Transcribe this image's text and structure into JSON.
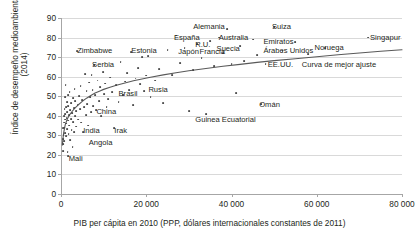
{
  "chart_data": {
    "type": "scatter",
    "title": "",
    "xlabel": "PIB per cápita en 2010 (PPP, dólares internacionales constantes de 2011)",
    "ylabel": "Índice de desempeño medioambiental\n(2014)",
    "xlim": [
      0,
      80000
    ],
    "ylim": [
      0,
      90
    ],
    "xticks": [
      0,
      20000,
      40000,
      60000,
      80000
    ],
    "xticklabels": [
      "0",
      "20 000",
      "40 000",
      "60 000",
      "80 000"
    ],
    "yticks": [
      0,
      10,
      20,
      30,
      40,
      50,
      60,
      70,
      80,
      90
    ],
    "yticklabels": [
      "0",
      "10",
      "20",
      "30",
      "40",
      "50",
      "60",
      "70",
      "80",
      "90"
    ],
    "grid": "horizontal",
    "legend": "none",
    "point_color": "#4a4a4a",
    "curve_color": "#595959",
    "grid_color": "#d9d9d9",
    "annotations": [
      {
        "text": "Zimbabwe",
        "x": 3800,
        "y": 73,
        "align": "left"
      },
      {
        "text": "Serbia",
        "x": 7300,
        "y": 66,
        "align": "left"
      },
      {
        "text": "Estonia",
        "x": 16500,
        "y": 73,
        "align": "left"
      },
      {
        "text": "España",
        "x": 26500,
        "y": 80,
        "align": "left"
      },
      {
        "text": "Alemania",
        "x": 31000,
        "y": 85.5,
        "align": "left"
      },
      {
        "text": "Suiza",
        "x": 49500,
        "y": 85.5,
        "align": "left"
      },
      {
        "text": "Australia",
        "x": 37000,
        "y": 80,
        "align": "left"
      },
      {
        "text": "R.U.",
        "x": 31500,
        "y": 76,
        "align": "left"
      },
      {
        "text": "Suecia",
        "x": 36500,
        "y": 74,
        "align": "left"
      },
      {
        "text": "Japón",
        "x": 27500,
        "y": 72.5,
        "align": "left"
      },
      {
        "text": "Francia",
        "x": 32500,
        "y": 72.5,
        "align": "left"
      },
      {
        "text": "Emiratos\nÁrabes Unidos",
        "x": 47500,
        "y": 77.5,
        "align": "left"
      },
      {
        "text": "Noruega",
        "x": 59500,
        "y": 74.5,
        "align": "left"
      },
      {
        "text": "Singapur",
        "x": 72500,
        "y": 80,
        "align": "left"
      },
      {
        "text": "EE.UU.",
        "x": 48500,
        "y": 66,
        "align": "left"
      },
      {
        "text": "Curva de mejor ajuste",
        "x": 56500,
        "y": 66,
        "align": "left"
      },
      {
        "text": "Brasil",
        "x": 13500,
        "y": 51,
        "align": "left"
      },
      {
        "text": "Rusia",
        "x": 20500,
        "y": 53,
        "align": "left"
      },
      {
        "text": "China",
        "x": 8300,
        "y": 42,
        "align": "left"
      },
      {
        "text": "India",
        "x": 5200,
        "y": 32,
        "align": "left"
      },
      {
        "text": "Irak",
        "x": 12500,
        "y": 32,
        "align": "left"
      },
      {
        "text": "Angola",
        "x": 6500,
        "y": 26,
        "align": "left"
      },
      {
        "text": "Mali",
        "x": 1800,
        "y": 18,
        "align": "left"
      },
      {
        "text": "Omán",
        "x": 46500,
        "y": 45.5,
        "align": "left"
      },
      {
        "text": "Guinea Ecuatorial",
        "x": 31500,
        "y": 38,
        "align": "left"
      }
    ],
    "fit_curve": {
      "label": "Curva de mejor ajuste",
      "points": [
        [
          300,
          25.0
        ],
        [
          600,
          31.0
        ],
        [
          1000,
          35.5
        ],
        [
          1500,
          38.5
        ],
        [
          2000,
          40.5
        ],
        [
          2600,
          42.2
        ],
        [
          3200,
          43.8
        ],
        [
          4000,
          45.5
        ],
        [
          5000,
          47.4
        ],
        [
          6000,
          49.0
        ],
        [
          7000,
          50.4
        ],
        [
          8000,
          51.6
        ],
        [
          9000,
          52.6
        ],
        [
          10000,
          53.5
        ],
        [
          11500,
          54.6
        ],
        [
          13000,
          55.6
        ],
        [
          15000,
          56.8
        ],
        [
          17000,
          57.9
        ],
        [
          19000,
          58.8
        ],
        [
          21000,
          59.7
        ],
        [
          24000,
          60.9
        ],
        [
          27000,
          62.0
        ],
        [
          30000,
          63.0
        ],
        [
          34000,
          64.2
        ],
        [
          38000,
          65.3
        ],
        [
          42000,
          66.3
        ],
        [
          46000,
          67.3
        ],
        [
          50000,
          68.2
        ],
        [
          55000,
          69.2
        ],
        [
          60000,
          70.2
        ],
        [
          65000,
          71.2
        ],
        [
          70000,
          72.1
        ],
        [
          75000,
          73.0
        ],
        [
          80000,
          73.8
        ]
      ]
    },
    "points": [
      [
        400,
        25.5
      ],
      [
        450,
        22.0
      ],
      [
        500,
        28.0
      ],
      [
        550,
        33.5
      ],
      [
        600,
        30.0
      ],
      [
        650,
        36.5
      ],
      [
        700,
        27.0
      ],
      [
        750,
        40.0
      ],
      [
        800,
        34.0
      ],
      [
        850,
        43.5
      ],
      [
        900,
        38.0
      ],
      [
        950,
        31.0
      ],
      [
        1000,
        49.5
      ],
      [
        1050,
        41.0
      ],
      [
        1100,
        55.8
      ],
      [
        1150,
        36.0
      ],
      [
        1200,
        29.5
      ],
      [
        1250,
        44.5
      ],
      [
        1300,
        39.0
      ],
      [
        1350,
        47.0
      ],
      [
        1400,
        33.0
      ],
      [
        1500,
        42.0
      ],
      [
        1550,
        21.5
      ],
      [
        1600,
        37.5
      ],
      [
        1650,
        50.5
      ],
      [
        1700,
        19.5
      ],
      [
        1750,
        45.0
      ],
      [
        1800,
        30.5
      ],
      [
        1900,
        40.5
      ],
      [
        1950,
        35.0
      ],
      [
        2000,
        52.0
      ],
      [
        2100,
        27.5
      ],
      [
        2200,
        43.0
      ],
      [
        2300,
        38.5
      ],
      [
        2400,
        46.5
      ],
      [
        2500,
        32.5
      ],
      [
        2600,
        41.5
      ],
      [
        2700,
        24.0
      ],
      [
        2800,
        49.0
      ],
      [
        2900,
        36.8
      ],
      [
        3000,
        44.0
      ],
      [
        3100,
        31.5
      ],
      [
        3200,
        53.5
      ],
      [
        3300,
        40.0
      ],
      [
        3400,
        47.5
      ],
      [
        3500,
        34.5
      ],
      [
        3600,
        42.5
      ],
      [
        3800,
        73.0
      ],
      [
        3900,
        45.5
      ],
      [
        4000,
        38.0
      ],
      [
        4200,
        50.0
      ],
      [
        4400,
        43.5
      ],
      [
        4600,
        55.0
      ],
      [
        4800,
        36.5
      ],
      [
        5000,
        48.0
      ],
      [
        5200,
        31.5
      ],
      [
        5400,
        44.5
      ],
      [
        5600,
        61.5
      ],
      [
        5800,
        40.5
      ],
      [
        6000,
        52.5
      ],
      [
        6200,
        46.0
      ],
      [
        6400,
        35.0
      ],
      [
        6600,
        57.0
      ],
      [
        6800,
        49.5
      ],
      [
        7000,
        42.0
      ],
      [
        7200,
        61.0
      ],
      [
        7400,
        53.0
      ],
      [
        7600,
        45.0
      ],
      [
        7800,
        66.0
      ],
      [
        8000,
        50.5
      ],
      [
        8300,
        43.0
      ],
      [
        8600,
        58.0
      ],
      [
        8900,
        47.5
      ],
      [
        9200,
        54.5
      ],
      [
        9500,
        40.0
      ],
      [
        9800,
        62.5
      ],
      [
        10100,
        51.0
      ],
      [
        10400,
        56.5
      ],
      [
        10700,
        44.5
      ],
      [
        11000,
        48.5
      ],
      [
        11500,
        59.5
      ],
      [
        12000,
        52.0
      ],
      [
        12500,
        33.5
      ],
      [
        13000,
        55.5
      ],
      [
        13500,
        47.0
      ],
      [
        14000,
        67.5
      ],
      [
        14500,
        50.5
      ],
      [
        15000,
        57.5
      ],
      [
        15500,
        62.0
      ],
      [
        16000,
        53.0
      ],
      [
        16500,
        72.5
      ],
      [
        17000,
        45.5
      ],
      [
        17500,
        59.0
      ],
      [
        18000,
        64.5
      ],
      [
        18500,
        56.0
      ],
      [
        19000,
        70.0
      ],
      [
        19500,
        52.5
      ],
      [
        20000,
        60.5
      ],
      [
        20500,
        70.5
      ],
      [
        21000,
        49.5
      ],
      [
        22000,
        58.0
      ],
      [
        23000,
        64.0
      ],
      [
        24000,
        46.5
      ],
      [
        25000,
        73.5
      ],
      [
        26000,
        61.0
      ],
      [
        27000,
        81.0
      ],
      [
        28000,
        67.0
      ],
      [
        29000,
        74.5
      ],
      [
        30000,
        42.5
      ],
      [
        31000,
        63.5
      ],
      [
        32000,
        76.5
      ],
      [
        33000,
        69.5
      ],
      [
        34000,
        41.0
      ],
      [
        35000,
        78.0
      ],
      [
        36000,
        65.5
      ],
      [
        37000,
        80.0
      ],
      [
        38000,
        72.0
      ],
      [
        39000,
        84.5
      ],
      [
        40000,
        66.5
      ],
      [
        41000,
        51.5
      ],
      [
        42000,
        75.5
      ],
      [
        43000,
        68.0
      ],
      [
        45000,
        79.0
      ],
      [
        46000,
        71.0
      ],
      [
        47000,
        46.0
      ],
      [
        48000,
        66.5
      ],
      [
        50000,
        85.5
      ],
      [
        52000,
        73.0
      ],
      [
        55000,
        77.5
      ],
      [
        58000,
        71.5
      ],
      [
        62000,
        74.5
      ],
      [
        72000,
        80.0
      ]
    ]
  }
}
